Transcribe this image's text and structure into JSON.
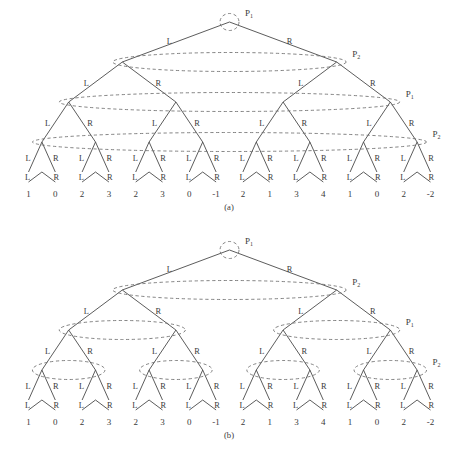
{
  "figure": {
    "background": "#ffffff",
    "stroke_edge": "#4a4a4a",
    "stroke_group": "#6e6e6e",
    "text_color": "#3a3a3a"
  },
  "panels": [
    {
      "id": "a",
      "caption": "(a)",
      "branch_left_label": "L",
      "branch_right_label": "R",
      "depth": 4,
      "leaf_values": [
        "1",
        "0",
        "2",
        "3",
        "2",
        "3",
        "0",
        "-1",
        "2",
        "1",
        "3",
        "4",
        "1",
        "0",
        "2",
        "-2"
      ],
      "processor_labels": [
        {
          "level": 0,
          "name": "P",
          "sub": "1"
        },
        {
          "level": 1,
          "name": "P",
          "sub": "2"
        },
        {
          "level": 2,
          "name": "P",
          "sub": "1"
        },
        {
          "level": 3,
          "name": "P",
          "sub": "2"
        }
      ],
      "groupings": [
        {
          "level": 0,
          "groups": 1,
          "nodes_per_group": 1
        },
        {
          "level": 1,
          "groups": 1,
          "nodes_per_group": 2
        },
        {
          "level": 2,
          "groups": 1,
          "nodes_per_group": 4
        },
        {
          "level": 3,
          "groups": 1,
          "nodes_per_group": 8
        }
      ]
    },
    {
      "id": "b",
      "caption": "(b)",
      "branch_left_label": "L",
      "branch_right_label": "R",
      "depth": 4,
      "leaf_values": [
        "1",
        "0",
        "2",
        "3",
        "2",
        "3",
        "0",
        "-1",
        "2",
        "1",
        "3",
        "4",
        "1",
        "0",
        "2",
        "-2"
      ],
      "processor_labels": [
        {
          "level": 0,
          "name": "P",
          "sub": "1"
        },
        {
          "level": 1,
          "name": "P",
          "sub": "2"
        },
        {
          "level": 2,
          "name": "P",
          "sub": "1"
        },
        {
          "level": 3,
          "name": "P",
          "sub": "2"
        }
      ],
      "groupings": [
        {
          "level": 0,
          "groups": 1,
          "nodes_per_group": 1
        },
        {
          "level": 1,
          "groups": 1,
          "nodes_per_group": 2
        },
        {
          "level": 2,
          "groups": 2,
          "nodes_per_group": 2
        },
        {
          "level": 3,
          "groups": 4,
          "nodes_per_group": 2
        }
      ]
    }
  ],
  "chart_data": {
    "type": "diagram",
    "title": "",
    "subtitle": "",
    "tree_depth": 4,
    "leaf_count": 16,
    "leaf_values": [
      1,
      0,
      2,
      3,
      2,
      3,
      0,
      -1,
      2,
      1,
      3,
      4,
      1,
      0,
      2,
      -2
    ],
    "edge_labels": [
      "L",
      "R"
    ],
    "level_processor_assignment": [
      "P1",
      "P2",
      "P1",
      "P2"
    ],
    "panel_a_groups_per_level": [
      1,
      1,
      1,
      1
    ],
    "panel_b_groups_per_level": [
      1,
      1,
      2,
      4
    ],
    "captions": [
      "(a)",
      "(b)"
    ]
  },
  "footer": {
    "text": ""
  }
}
